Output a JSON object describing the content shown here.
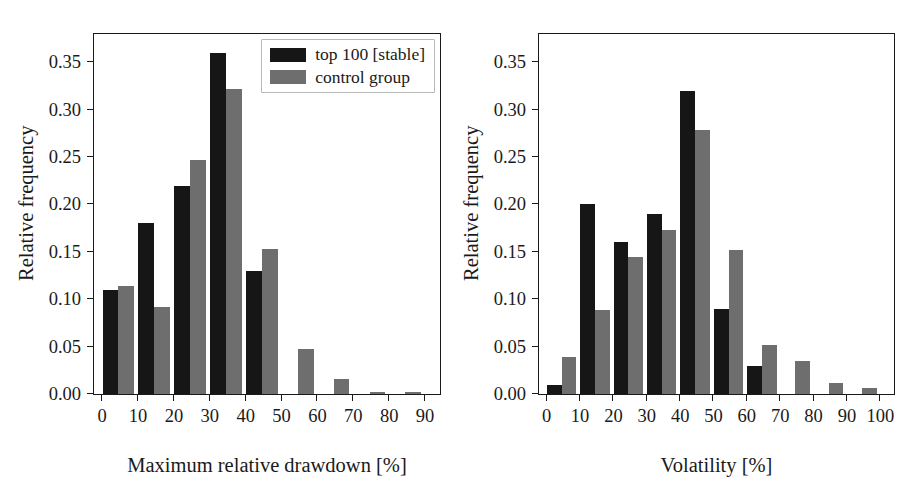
{
  "figure": {
    "panels": [
      "drawdown",
      "volatility"
    ],
    "colors": {
      "series_top100": "#161616",
      "series_control": "#6e6e6e",
      "axis": "#1a1a1a",
      "background": "#ffffff"
    }
  },
  "legend": {
    "position": "upper-right",
    "entries": [
      {
        "label": "top 100 [stable]",
        "color": "#161616"
      },
      {
        "label": "control group",
        "color": "#6e6e6e"
      }
    ]
  },
  "chart_data": [
    {
      "id": "drawdown",
      "type": "bar",
      "title": "",
      "xlabel": "Maximum relative drawdown [%]",
      "ylabel": "Relative frequency",
      "xlim": [
        -2,
        95
      ],
      "ylim": [
        0.0,
        0.382
      ],
      "grid": false,
      "legend_position": "upper right",
      "xticks": [
        0,
        10,
        20,
        30,
        40,
        50,
        60,
        70,
        80,
        90
      ],
      "xticklabels": [
        "0",
        "10",
        "20",
        "30",
        "40",
        "50",
        "60",
        "70",
        "80",
        "90"
      ],
      "yticks": [
        0.0,
        0.05,
        0.1,
        0.15,
        0.2,
        0.25,
        0.3,
        0.35
      ],
      "yticklabels": [
        "0.00",
        "0.05",
        "0.10",
        "0.15",
        "0.20",
        "0.25",
        "0.30",
        "0.35"
      ],
      "bin_edges": [
        0,
        10,
        20,
        30,
        40,
        50,
        60,
        70,
        80,
        90
      ],
      "categories": [
        "0-10",
        "10-20",
        "20-30",
        "30-40",
        "40-50",
        "50-60",
        "60-70",
        "70-80",
        "80-90"
      ],
      "series": [
        {
          "name": "top 100 [stable]",
          "color": "#161616",
          "values": [
            0.11,
            0.18,
            0.22,
            0.36,
            0.13,
            0.0,
            0.0,
            0.0,
            0.0
          ]
        },
        {
          "name": "control group",
          "color": "#6e6e6e",
          "values": [
            0.114,
            0.092,
            0.247,
            0.322,
            0.153,
            0.048,
            0.016,
            0.002,
            0.002
          ]
        }
      ]
    },
    {
      "id": "volatility",
      "type": "bar",
      "title": "",
      "xlabel": "Volatility [%]",
      "ylabel": "Relative frequency",
      "xlim": [
        -2,
        105
      ],
      "ylim": [
        0.0,
        0.382
      ],
      "grid": false,
      "legend_position": "none",
      "xticks": [
        0,
        10,
        20,
        30,
        40,
        50,
        60,
        70,
        80,
        90,
        100
      ],
      "xticklabels": [
        "0",
        "10",
        "20",
        "30",
        "40",
        "50",
        "60",
        "70",
        "80",
        "90",
        "100"
      ],
      "yticks": [
        0.0,
        0.05,
        0.1,
        0.15,
        0.2,
        0.25,
        0.3,
        0.35
      ],
      "yticklabels": [
        "0.00",
        "0.05",
        "0.10",
        "0.15",
        "0.20",
        "0.25",
        "0.30",
        "0.35"
      ],
      "bin_edges": [
        0,
        10,
        20,
        30,
        40,
        50,
        60,
        70,
        80,
        90,
        100
      ],
      "categories": [
        "0-10",
        "10-20",
        "20-30",
        "30-40",
        "40-50",
        "50-60",
        "60-70",
        "70-80",
        "80-90",
        "90-100"
      ],
      "series": [
        {
          "name": "top 100 [stable]",
          "color": "#161616",
          "values": [
            0.01,
            0.2,
            0.16,
            0.19,
            0.32,
            0.09,
            0.03,
            0.0,
            0.0,
            0.0
          ]
        },
        {
          "name": "control group",
          "color": "#6e6e6e",
          "values": [
            0.039,
            0.089,
            0.145,
            0.173,
            0.279,
            0.152,
            0.052,
            0.035,
            0.012,
            0.006
          ]
        }
      ]
    }
  ]
}
